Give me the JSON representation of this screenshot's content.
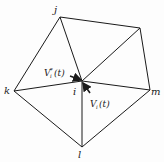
{
  "diagram": {
    "vertices": {
      "j": {
        "label": "j",
        "x": 60,
        "y": 17
      },
      "n": {
        "label": "",
        "x": 140,
        "y": 28
      },
      "m": {
        "label": "m",
        "x": 150,
        "y": 90
      },
      "l": {
        "label": "l",
        "x": 82,
        "y": 147
      },
      "k": {
        "label": "k",
        "x": 14,
        "y": 91
      },
      "i": {
        "label": "i",
        "x": 82,
        "y": 81
      }
    },
    "vector_labels": {
      "v_star": "V",
      "v_star_sub": "i",
      "v_star_sup": "*",
      "v_star_arg": "(t)",
      "v": "V",
      "v_sub": "i",
      "v_arg": "(t)"
    },
    "colors": {
      "stroke": "#1a1a1a",
      "background": "#fdfdfd"
    }
  }
}
